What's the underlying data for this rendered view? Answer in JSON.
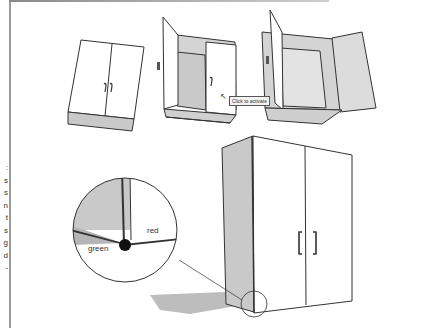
{
  "figure": {
    "left_margin_fragments": [
      ":",
      "s",
      "s",
      "n",
      "t",
      "s",
      "g",
      "d",
      "-"
    ],
    "tooltip": {
      "text": "Click to activate",
      "cursor_icon": "pointer-cursor-icon"
    },
    "callout": {
      "axis_labels": {
        "red": "red",
        "green": "green"
      }
    },
    "colors": {
      "outline": "#333333",
      "side_shade": "#c9c9c9",
      "interior_shade": "#d4d4d4",
      "shadow": "#bdbdbd",
      "door_face": "#ffffff"
    },
    "panels": [
      {
        "name": "cabinet-closed-small",
        "state": "doors closed"
      },
      {
        "name": "cabinet-one-door-open",
        "state": "one door open"
      },
      {
        "name": "cabinet-both-doors-open",
        "state": "both doors open"
      },
      {
        "name": "cabinet-large",
        "state": "doors closed, corner magnified"
      }
    ]
  }
}
